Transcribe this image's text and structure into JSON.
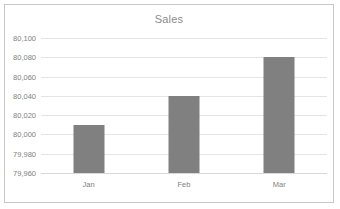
{
  "chart_data": {
    "type": "bar",
    "title": "Sales",
    "xlabel": "",
    "ylabel": "",
    "categories": [
      "Jan",
      "Feb",
      "Mar"
    ],
    "values": [
      80010,
      80040,
      80080
    ],
    "value_labels": [
      "80,010",
      "80,040",
      "80,080"
    ],
    "ylim": [
      79960,
      80100
    ],
    "ytick_step": 20,
    "ytick_labels": [
      "80,100",
      "80,080",
      "80,060",
      "80,040",
      "80,020",
      "80,000",
      "79,980",
      "79,960"
    ],
    "ytick_values": [
      80100,
      80080,
      80060,
      80040,
      80020,
      80000,
      79980,
      79960
    ],
    "grid": true,
    "legend": false,
    "legend_position": "none",
    "series": [
      {
        "name": "Sales",
        "values": [
          80010,
          80040,
          80080
        ]
      }
    ]
  },
  "colors": {
    "bar_fill": "#808080",
    "gridline": "#e4e4e4",
    "axis_line": "#d9d9d9",
    "frame_border": "#c8c8c8",
    "title_text": "#8c8c8c",
    "tick_text": "#808080",
    "plot_background": "#ffffff"
  }
}
